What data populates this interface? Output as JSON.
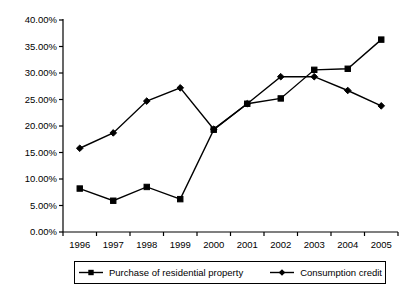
{
  "chart_data": {
    "type": "line",
    "title": "",
    "xlabel": "",
    "ylabel": "",
    "categories": [
      "1996",
      "1997",
      "1998",
      "1999",
      "2000",
      "2001",
      "2002",
      "2003",
      "2004",
      "2005"
    ],
    "ylim": [
      0,
      40
    ],
    "ytick_values": [
      0,
      5,
      10,
      15,
      20,
      25,
      30,
      35,
      40
    ],
    "ytick_labels": [
      "0.00%",
      "5.00%",
      "10.00%",
      "15.00%",
      "20.00%",
      "25.00%",
      "30.00%",
      "35.00%",
      "40.00%"
    ],
    "grid": false,
    "legend_position": "bottom",
    "series": [
      {
        "name": "Purchase of residential property",
        "marker": "square",
        "color": "#000000",
        "values": [
          8.2,
          5.9,
          8.5,
          6.2,
          19.3,
          24.2,
          25.2,
          30.6,
          30.8,
          36.3
        ]
      },
      {
        "name": "Consumption credit",
        "marker": "diamond",
        "color": "#000000",
        "values": [
          15.8,
          18.7,
          24.7,
          27.2,
          19.4,
          24.2,
          29.3,
          29.3,
          26.7,
          23.8
        ]
      }
    ]
  },
  "axes": {
    "axis_color": "#000000",
    "line_width": 1
  },
  "legend": {
    "entries": [
      {
        "label": "Purchase of residential property",
        "marker": "square-marker"
      },
      {
        "label": "Consumption credit",
        "marker": "diamond-marker"
      }
    ]
  }
}
